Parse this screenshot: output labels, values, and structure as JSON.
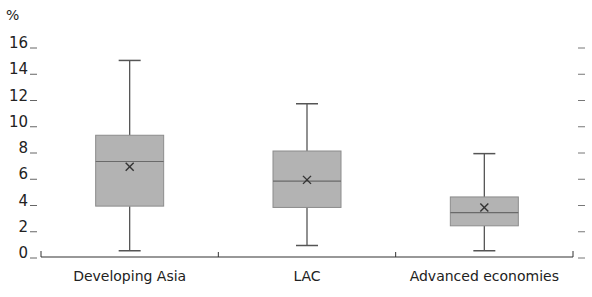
{
  "chart_data": {
    "type": "boxplot",
    "title": "",
    "xlabel": "",
    "ylabel": "%",
    "ylim": [
      0,
      16
    ],
    "yticks": [
      0,
      2,
      4,
      6,
      8,
      10,
      12,
      14,
      16
    ],
    "grid": false,
    "legend": null,
    "categories": [
      "Developing Asia",
      "LAC",
      "Advanced economies"
    ],
    "series": [
      {
        "name": "Developing Asia",
        "min": 0.4,
        "q1": 3.8,
        "median": 7.2,
        "q3": 9.2,
        "max": 14.9,
        "mean": 6.8
      },
      {
        "name": "LAC",
        "min": 0.8,
        "q1": 3.7,
        "median": 5.7,
        "q3": 8.0,
        "max": 11.6,
        "mean": 5.8
      },
      {
        "name": "Advanced economies",
        "min": 0.4,
        "q1": 2.3,
        "median": 3.3,
        "q3": 4.5,
        "max": 7.8,
        "mean": 3.7
      }
    ],
    "colors": {
      "box_fill": "#b3b3b3",
      "box_stroke": "#8c8c8c",
      "whisker": "#555555",
      "axis": "#333333",
      "mean_marker": "#333333"
    }
  }
}
